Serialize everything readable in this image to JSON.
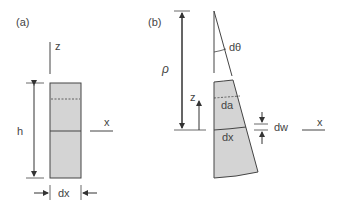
{
  "panel_a": {
    "label": "(a)",
    "z_label": "z",
    "x_label": "x",
    "h_label": "h",
    "dx_label": "dx"
  },
  "panel_b": {
    "label": "(b)",
    "rho_label": "ρ",
    "dtheta_label": "dθ",
    "z_label": "z",
    "da_label": "da",
    "dx_label": "dx",
    "dw_label": "dw",
    "x_label": "x"
  },
  "colors": {
    "fill": "#d4d4d4",
    "stroke": "#444444"
  }
}
